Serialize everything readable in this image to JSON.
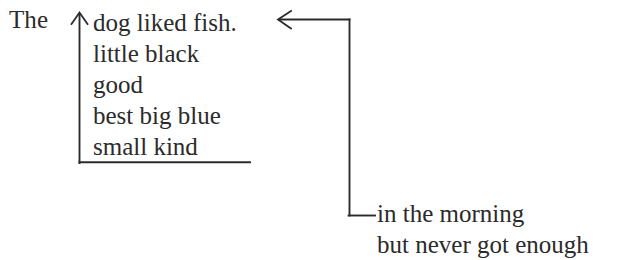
{
  "diagram": {
    "background_color": "#ffffff",
    "ink_color": "#2b2b2b",
    "lead_word": "The",
    "subject_stack": [
      {
        "text": "dog liked fish."
      },
      {
        "text": "little black"
      },
      {
        "text": "good"
      },
      {
        "text": "best big blue"
      },
      {
        "text": "small kind"
      }
    ],
    "tail_stack": [
      {
        "text": "in the morning"
      },
      {
        "text": "but never got enough"
      }
    ],
    "connectors": {
      "left_bracket": {
        "name": "up-arrow-bracket",
        "description": "vertical rule with upward arrowhead joining the stacked modifiers back to 'The'"
      },
      "right_bracket": {
        "name": "left-arrow-elbow",
        "description": "arrow pointing left into the first line, elbowing down and right to the tail phrases"
      }
    }
  }
}
